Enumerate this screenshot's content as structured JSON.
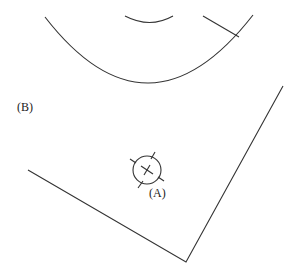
{
  "labels": {
    "a": "(A)",
    "b": "(B)"
  },
  "colors": {
    "stroke": "#333333",
    "background": "#ffffff"
  }
}
